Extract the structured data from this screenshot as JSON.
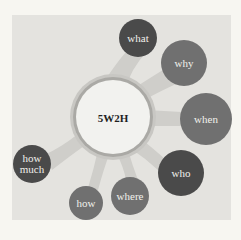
{
  "diagram": {
    "title": "5W2H",
    "center": {
      "label": "5W2H",
      "x": 113,
      "y": 117,
      "r": 38
    },
    "colors": {
      "background": "#f7f6f1",
      "panel": "#e4e3df",
      "connector": "#cfceca",
      "center_fill": "#f2f2ef",
      "center_ring": "#aaa9a5",
      "dark": "#4a4a4a",
      "medium": "#707070"
    },
    "nodes": [
      {
        "label": "what",
        "x": 138,
        "y": 38,
        "r": 19,
        "tone": "dark"
      },
      {
        "label": "why",
        "x": 184,
        "y": 63,
        "r": 23,
        "tone": "medium"
      },
      {
        "label": "when",
        "x": 206,
        "y": 119,
        "r": 26,
        "tone": "medium"
      },
      {
        "label": "who",
        "x": 181,
        "y": 173,
        "r": 23,
        "tone": "dark"
      },
      {
        "label": "where",
        "x": 130,
        "y": 196,
        "r": 19,
        "tone": "medium"
      },
      {
        "label": "how",
        "x": 86,
        "y": 203,
        "r": 17,
        "tone": "medium"
      },
      {
        "label": "how\nmuch",
        "x": 32,
        "y": 164,
        "r": 19,
        "tone": "dark"
      }
    ]
  }
}
